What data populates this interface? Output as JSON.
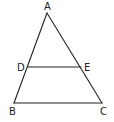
{
  "diagram": {
    "type": "geometry-triangle",
    "stroke_color": "#222222",
    "background": "#ffffff",
    "points": {
      "A": {
        "label": "A",
        "x": 47,
        "y": 13,
        "label_x": 44,
        "label_y": 10
      },
      "B": {
        "label": "B",
        "x": 14,
        "y": 103,
        "label_x": 9,
        "label_y": 115
      },
      "C": {
        "label": "C",
        "x": 102,
        "y": 103,
        "label_x": 100,
        "label_y": 115
      },
      "D": {
        "label": "D",
        "x": 28,
        "y": 67,
        "label_x": 17,
        "label_y": 71
      },
      "E": {
        "label": "E",
        "x": 81,
        "y": 67,
        "label_x": 84,
        "label_y": 71
      }
    },
    "segments": [
      {
        "name": "AB",
        "from": "A",
        "to": "B"
      },
      {
        "name": "AC",
        "from": "A",
        "to": "C"
      },
      {
        "name": "BC",
        "from": "B",
        "to": "C"
      },
      {
        "name": "DE",
        "from": "D",
        "to": "E"
      }
    ]
  }
}
